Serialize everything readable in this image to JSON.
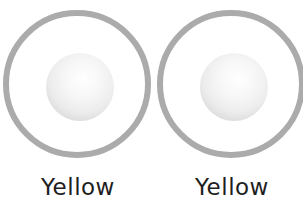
{
  "items": [
    {
      "label": "Yellow",
      "ring_color": "#ababab",
      "ball_color": "#e8e8e8"
    },
    {
      "label": "Yellow",
      "ring_color": "#ababab",
      "ball_color": "#e8e8e8"
    }
  ]
}
